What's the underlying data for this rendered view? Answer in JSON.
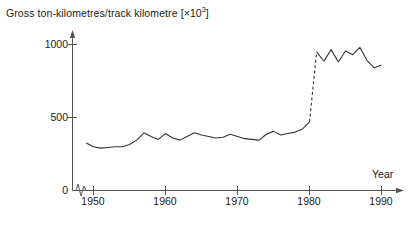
{
  "chart_data": {
    "type": "line",
    "title_plain": "Gross ton-kilometres/track kilometre",
    "title_unit_base": "×10",
    "title_unit_exp": "3",
    "xlabel": "Year",
    "ylabel": "",
    "xlim": [
      1948,
      1991
    ],
    "ylim": [
      0,
      1060
    ],
    "xticks": [
      "1950",
      "1960",
      "1970",
      "1980",
      "1990"
    ],
    "xtick_values": [
      1950,
      1960,
      1970,
      1980,
      1990
    ],
    "yticks": [
      "0",
      "500",
      "1000"
    ],
    "ytick_values": [
      0,
      500,
      1000
    ],
    "grid": false,
    "legend": false,
    "axis_break": true,
    "axis_break_note": "zigzag break on x-axis just right of origin",
    "series": [
      {
        "name": "gross-ton-km-per-track-km",
        "style": "solid",
        "x": [
          1949,
          1950,
          1951,
          1952,
          1953,
          1954,
          1955,
          1956,
          1957,
          1958,
          1959,
          1960,
          1961,
          1962,
          1963,
          1964,
          1965,
          1966,
          1967,
          1968,
          1969,
          1970,
          1971,
          1972,
          1973,
          1974,
          1975,
          1976,
          1977,
          1978,
          1979,
          1980
        ],
        "values": [
          325,
          300,
          290,
          295,
          300,
          300,
          315,
          345,
          395,
          370,
          350,
          390,
          360,
          345,
          370,
          395,
          380,
          370,
          360,
          365,
          385,
          370,
          355,
          350,
          345,
          385,
          405,
          380,
          390,
          400,
          420,
          470
        ]
      },
      {
        "name": "gross-ton-km-per-track-km-transition",
        "style": "dashed",
        "x": [
          1980,
          1981
        ],
        "values": [
          470,
          950
        ]
      },
      {
        "name": "gross-ton-km-per-track-km-late",
        "style": "solid",
        "x": [
          1981,
          1982,
          1983,
          1984,
          1985,
          1986,
          1987,
          1988,
          1989,
          1990
        ],
        "values": [
          950,
          885,
          965,
          880,
          955,
          930,
          980,
          890,
          840,
          860
        ]
      }
    ],
    "colors": {
      "line": "#333333",
      "axis": "#555555",
      "background": "#ffffff"
    }
  }
}
